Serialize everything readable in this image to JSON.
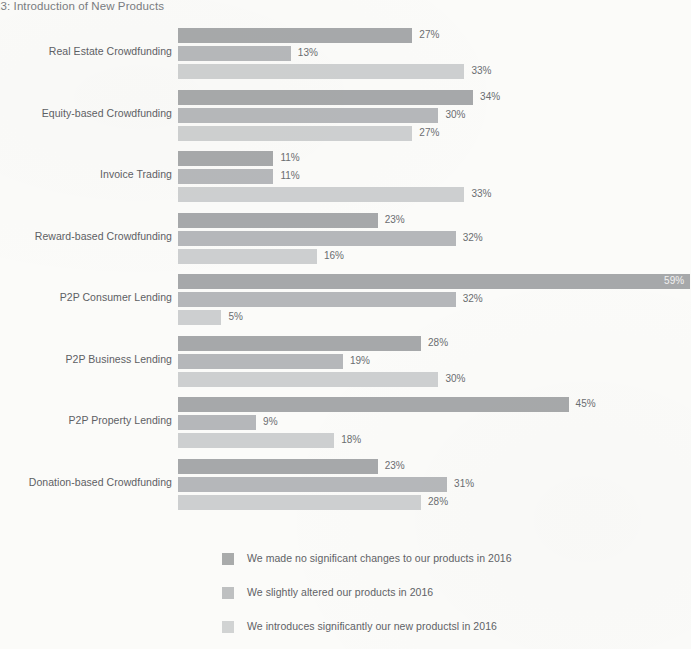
{
  "title": "23: Introduction of New Products",
  "chart_data": {
    "type": "bar",
    "orientation": "horizontal",
    "title": "23: Introduction of New Products",
    "xlabel": "",
    "ylabel": "",
    "xlim": [
      0,
      59
    ],
    "grid": false,
    "legend_position": "bottom",
    "value_suffix": "%",
    "categories": [
      "Real Estate Crowdfunding",
      "Equity-based Crowdfunding",
      "Invoice Trading",
      "Reward-based Crowdfunding",
      "P2P Consumer Lending",
      "P2P Business Lending",
      "P2P Property Lending",
      "Donation-based Crowdfunding"
    ],
    "series": [
      {
        "name": "We made no significant changes to our products in 2016",
        "color": "#9a9c9e",
        "values": [
          27,
          34,
          11,
          23,
          59,
          28,
          45,
          23
        ],
        "labels": [
          "27%",
          "34%",
          "11%",
          "23%",
          "59%",
          "28%",
          "45%",
          "23%"
        ]
      },
      {
        "name": "We slightly altered our products in 2016",
        "color": "#abadb0",
        "values": [
          13,
          30,
          11,
          32,
          32,
          19,
          9,
          31
        ],
        "labels": [
          "13%",
          "30%",
          "11%",
          "32%",
          "32%",
          "19%",
          "9%",
          "31%"
        ]
      },
      {
        "name": "We introduces significantly our new productsl in 2016",
        "color": "#c6c8ca",
        "values": [
          33,
          27,
          33,
          16,
          5,
          30,
          18,
          28
        ],
        "labels": [
          "33%",
          "27%",
          "33%",
          "16%",
          "5%",
          "30%",
          "18%",
          "28%"
        ]
      }
    ]
  },
  "legend": {
    "items": [
      {
        "label": "We made no significant changes to our products in 2016",
        "color": "#9a9c9e"
      },
      {
        "label": "We slightly altered our products in 2016",
        "color": "#b3b5b7"
      },
      {
        "label": "We introduces significantly our new productsl in 2016",
        "color": "#c9cbcd"
      }
    ]
  }
}
